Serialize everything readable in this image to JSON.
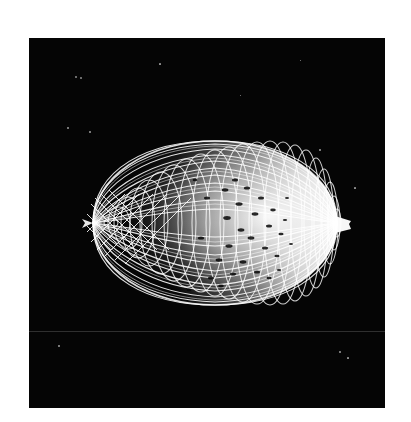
{
  "page": {
    "background_color": "#ffffff",
    "width": 411,
    "height": 422
  },
  "render_plate": {
    "label": "wireframe render viewport",
    "background_color": "#050505",
    "x": 29,
    "y": 38,
    "width": 356,
    "height": 370,
    "scan_line": {
      "label": "horizontal scan seam",
      "y": 331,
      "color": "#2b2b2b"
    }
  },
  "object": {
    "name": "wireframe ellipsoid",
    "description": "3D lemon-shaped ellipsoid rendered as a dense white lat-long wireframe mesh on a black background",
    "stroke_color": "#ffffff",
    "center_x": 215,
    "center_y": 223,
    "radius_x": 133,
    "radius_y": 84,
    "left_pole_x": 82,
    "right_pole_x": 348,
    "top_y": 141,
    "bottom_y": 305,
    "meridian_count": 34,
    "parallel_count": 22,
    "tip_length": 12
  },
  "speckles": [
    {
      "x": 76,
      "y": 77,
      "r": 1.3
    },
    {
      "x": 81,
      "y": 78,
      "r": 1.1
    },
    {
      "x": 68,
      "y": 128,
      "r": 0.8
    },
    {
      "x": 90,
      "y": 132,
      "r": 0.7
    },
    {
      "x": 160,
      "y": 64,
      "r": 0.6
    },
    {
      "x": 320,
      "y": 150,
      "r": 0.7
    },
    {
      "x": 355,
      "y": 188,
      "r": 0.6
    },
    {
      "x": 59,
      "y": 346,
      "r": 0.7
    },
    {
      "x": 340,
      "y": 352,
      "r": 0.8
    },
    {
      "x": 348,
      "y": 358,
      "r": 0.6
    },
    {
      "x": 240,
      "y": 95,
      "r": 0.5
    },
    {
      "x": 300,
      "y": 60,
      "r": 0.5
    }
  ]
}
